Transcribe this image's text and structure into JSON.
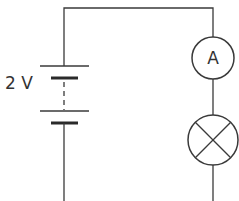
{
  "diagram": {
    "type": "circuit-diagram",
    "battery": {
      "label": "2 V",
      "cells": 2,
      "connection": "series (dashed link between cells)"
    },
    "components": [
      {
        "id": "ammeter",
        "symbol": "circle-with-letter",
        "letter": "A",
        "name": "Ammeter"
      },
      {
        "id": "lamp",
        "symbol": "circle-with-cross",
        "name": "Lamp"
      }
    ],
    "colors": {
      "stroke": "#3a3a3a",
      "background": "#ffffff"
    }
  }
}
